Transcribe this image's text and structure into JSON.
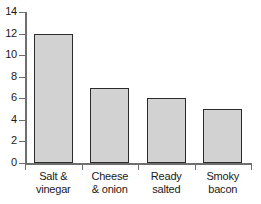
{
  "chart_data": {
    "type": "bar",
    "title": "",
    "subtitle": "",
    "xlabel": "",
    "ylabel": "",
    "categories": [
      "Salt & vinegar",
      "Cheese & onion",
      "Ready salted",
      "Smoky bacon"
    ],
    "values": [
      12,
      7,
      6,
      5
    ],
    "ylim": [
      0,
      14
    ],
    "yticks": [
      0,
      2,
      4,
      6,
      8,
      10,
      12,
      14
    ],
    "ytick_labels": [
      "0",
      "2",
      "4",
      "6",
      "8",
      "10",
      "12",
      "14"
    ],
    "grid": false,
    "legend": null,
    "bar_fill_color": "#d2d2d2",
    "bar_edge_color": "#2b2b2b",
    "axis_color": "#6e6e6e",
    "background_color": "#ffffff",
    "bars": [
      {
        "label_line1": "Salt &",
        "label_line2": "vinegar",
        "value": 12
      },
      {
        "label_line1": "Cheese",
        "label_line2": "& onion",
        "value": 7
      },
      {
        "label_line1": "Ready",
        "label_line2": "salted",
        "value": 6
      },
      {
        "label_line1": "Smoky",
        "label_line2": "bacon",
        "value": 5
      }
    ]
  }
}
